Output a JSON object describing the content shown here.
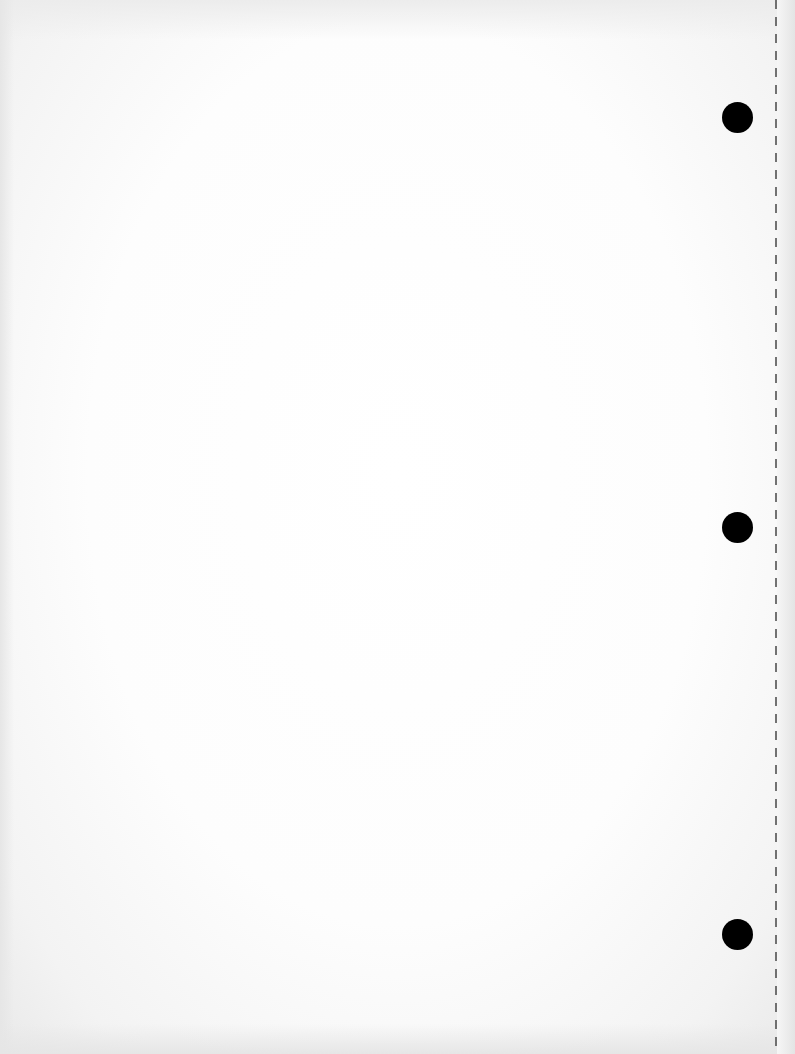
{
  "document": {
    "type": "blank-scanned-page",
    "text_content": "",
    "background_color": "#fdfdfd",
    "punch_holes": [
      {
        "name": "punch-hole-top",
        "cx": 738,
        "cy": 118
      },
      {
        "name": "punch-hole-middle",
        "cx": 738,
        "cy": 528
      },
      {
        "name": "punch-hole-bottom",
        "cx": 738,
        "cy": 935
      }
    ],
    "punch_hole_color": "#000000",
    "perforation_line": {
      "x": 776,
      "style": "dashed",
      "color": "#5a5a5a"
    }
  }
}
